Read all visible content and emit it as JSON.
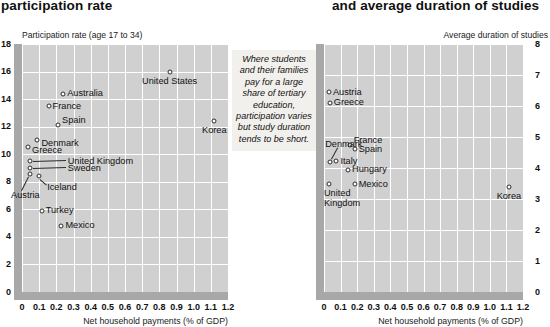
{
  "headline": {
    "left": "participation rate",
    "right": "and average duration of studies"
  },
  "pullquote": "Where students and their families pay for a large share of tertiary education, participation varies but study duration tends to be short.",
  "shared": {
    "xlabel": "Net household payments (% of GDP)",
    "xticks": [
      "0",
      "0.1",
      "0.2",
      "0.3",
      "0.4",
      "0.5",
      "0.6",
      "0.7",
      "0.8",
      "0.9",
      "1.0",
      "1.1",
      "1.2"
    ],
    "xlim": [
      0,
      1.2
    ],
    "plot_bg": "#d0d0d0",
    "grid_color": "#ffffff",
    "band_color": "#a8a8a8",
    "marker_edge": "#2b2b2b",
    "marker_fill": "#ffffff"
  },
  "chart_data": [
    {
      "id": "participation",
      "type": "scatter",
      "title": "participation rate",
      "ylabel": "Participation rate (age 17 to 34)",
      "xlabel": "Net household payments (% of GDP)",
      "xlim": [
        0,
        1.2
      ],
      "ylim": [
        0,
        18
      ],
      "yticks": [
        "0",
        "2",
        "4",
        "6",
        "8",
        "10",
        "12",
        "14",
        "16",
        "18"
      ],
      "ytick_side": "left",
      "grid": true,
      "legend": "none",
      "points": [
        {
          "name": "United States",
          "x": 0.86,
          "y": 16.0,
          "label_pos": "center-below"
        },
        {
          "name": "Korea",
          "x": 1.12,
          "y": 12.4,
          "label_pos": "center-below"
        },
        {
          "name": "Australia",
          "x": 0.24,
          "y": 14.4,
          "label_pos": "right"
        },
        {
          "name": "France",
          "x": 0.155,
          "y": 13.5,
          "label_pos": "right"
        },
        {
          "name": "Spain",
          "x": 0.21,
          "y": 12.1,
          "label_pos": "right-above"
        },
        {
          "name": "Denmark",
          "x": 0.09,
          "y": 11.0,
          "label_pos": "right-below"
        },
        {
          "name": "Greece",
          "x": 0.035,
          "y": 10.5,
          "label_pos": "right-below"
        },
        {
          "name": "United Kingdom",
          "x": 0.045,
          "y": 9.5,
          "label_pos": "leader-right"
        },
        {
          "name": "Sweden",
          "x": 0.045,
          "y": 9.0,
          "label_pos": "leader-right"
        },
        {
          "name": "Iceland",
          "x": 0.1,
          "y": 8.4,
          "label_pos": "leader-below"
        },
        {
          "name": "Austria",
          "x": 0.045,
          "y": 8.6,
          "label_pos": "leader-below-left"
        },
        {
          "name": "Turkey",
          "x": 0.115,
          "y": 5.9,
          "label_pos": "right"
        },
        {
          "name": "Mexico",
          "x": 0.23,
          "y": 4.8,
          "label_pos": "right"
        }
      ]
    },
    {
      "id": "duration",
      "type": "scatter",
      "title": "and average duration of studies",
      "ylabel": "Average duration of studies",
      "xlabel": "Net household payments (% of GDP)",
      "xlim": [
        0,
        1.2
      ],
      "ylim": [
        0,
        8
      ],
      "yticks": [
        "0",
        "1",
        "2",
        "3",
        "4",
        "5",
        "6",
        "7",
        "8"
      ],
      "ytick_side": "right",
      "grid": true,
      "legend": "none",
      "points": [
        {
          "name": "Austria",
          "x": 0.03,
          "y": 6.45,
          "label_pos": "right"
        },
        {
          "name": "Greece",
          "x": 0.035,
          "y": 6.1,
          "label_pos": "right"
        },
        {
          "name": "France",
          "x": 0.155,
          "y": 4.75,
          "label_pos": "right-above"
        },
        {
          "name": "Spain",
          "x": 0.185,
          "y": 4.6,
          "label_pos": "right"
        },
        {
          "name": "Denmark",
          "x": 0.035,
          "y": 4.2,
          "label_pos": "leader-above"
        },
        {
          "name": "Italy",
          "x": 0.075,
          "y": 4.22,
          "label_pos": "right"
        },
        {
          "name": "Hungary",
          "x": 0.145,
          "y": 3.95,
          "label_pos": "right"
        },
        {
          "name": "Mexico",
          "x": 0.185,
          "y": 3.48,
          "label_pos": "right"
        },
        {
          "name": "United Kingdom",
          "x": 0.03,
          "y": 3.5,
          "label_pos": "below-left"
        },
        {
          "name": "Korea",
          "x": 1.115,
          "y": 3.4,
          "label_pos": "center-below"
        }
      ]
    }
  ]
}
